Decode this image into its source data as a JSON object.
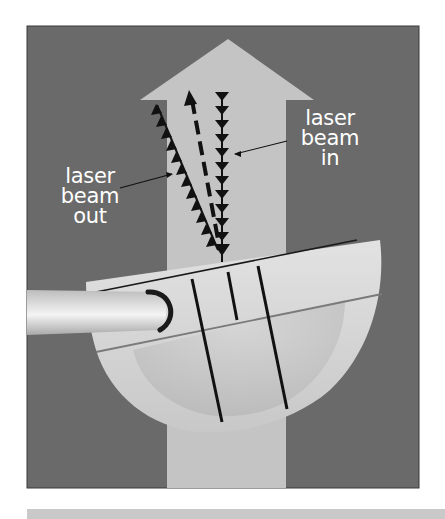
{
  "figure": {
    "type": "diagram",
    "colors": {
      "background_panel": "#6a6a6a",
      "target_arrow": "#c4c4c4",
      "putter_head": "#d8d8d8",
      "putter_shaft": "#e6e6e6",
      "lines": "#111111",
      "label_text": "#ffffff",
      "bottom_bar": "#c9c9c9"
    },
    "labels": {
      "beam_out": {
        "line1": "laser",
        "line2": "beam",
        "line3": "out"
      },
      "beam_in": {
        "line1": "laser",
        "line2": "beam",
        "line3": "in"
      }
    },
    "elements": {
      "target_arrow": "large upward arrow (target line)",
      "beam_in": "vertical line of downward triangles",
      "beam_out": "angled line of upward triangles",
      "center_beam": "dashed line with arrowhead",
      "putter": "mallet putter head with shaft and alignment lines"
    }
  }
}
